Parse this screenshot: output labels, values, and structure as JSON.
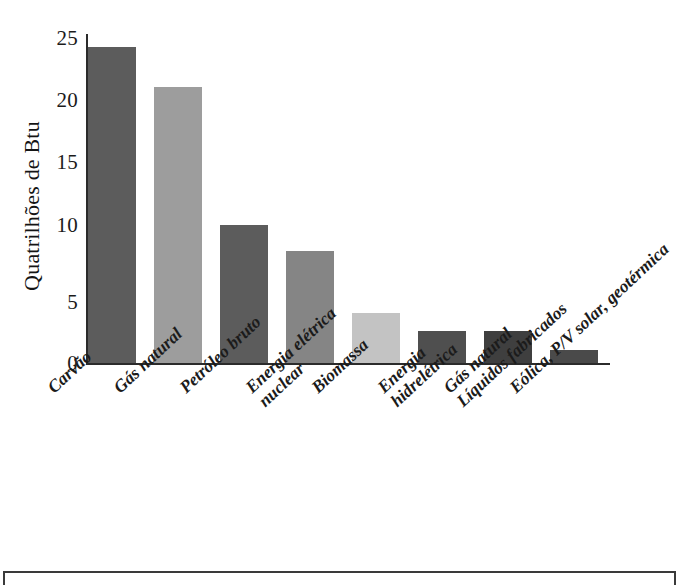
{
  "chart_data": {
    "type": "bar",
    "title": "",
    "xlabel": "",
    "ylabel": "Quatrilhões de Btu",
    "ylim": [
      0,
      25
    ],
    "yticks": [
      0,
      5,
      10,
      15,
      20,
      25
    ],
    "grid": false,
    "legend": null,
    "categories": [
      "Carvão",
      "Gás natural",
      "Petróleo bruto",
      "Energia elétrica nuclear",
      "Biomassa",
      "Energia hidrelétrica",
      "Gás natural Líquidos fabricados",
      "Eólica, P/V solar, geotérmica"
    ],
    "values": [
      24.0,
      21.0,
      10.5,
      8.5,
      3.8,
      2.4,
      2.4,
      1.0
    ],
    "bar_colors": [
      "#5c5c5c",
      "#9d9d9d",
      "#5c5c5c",
      "#858585",
      "#c3c3c3",
      "#4f4f4f",
      "#3f3f3f",
      "#4a4a4a"
    ],
    "annotations": []
  },
  "axis": {
    "y_title": "Quatrilhões de Btu",
    "y_tick_labels": [
      "25",
      "20",
      "15",
      "10",
      "5",
      "0"
    ]
  },
  "xlabels": [
    {
      "line1": "Carvão",
      "line2": ""
    },
    {
      "line1": "Gás natural",
      "line2": ""
    },
    {
      "line1": "Petróleo bruto",
      "line2": ""
    },
    {
      "line1": "Energia elétrica",
      "line2": "nuclear"
    },
    {
      "line1": "Biomassa",
      "line2": ""
    },
    {
      "line1": "Energia",
      "line2": "hidrelétrica"
    },
    {
      "line1": "Gás natural",
      "line2": "Líquidos fabricados"
    },
    {
      "line1": "Eólica, P/V solar, geotérmica",
      "line2": ""
    }
  ],
  "source": {
    "credit": "Energy Information Administration, Annual Energy Review (2013)"
  },
  "colors": {
    "axis": "#2b2b2b",
    "frame": "#3a3a3a",
    "text": "#1b1b1b",
    "source_text": "#3d3d3d",
    "background": "#ffffff"
  }
}
